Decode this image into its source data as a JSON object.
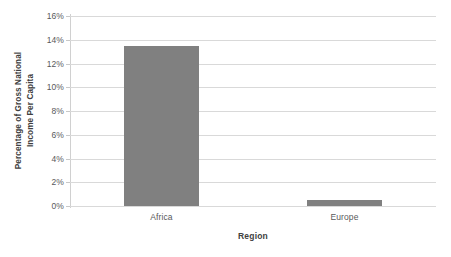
{
  "chart_data": {
    "type": "bar",
    "title": "",
    "subtitle": "",
    "categories": [
      "Africa",
      "Europe"
    ],
    "values": [
      13.5,
      0.5
    ],
    "series": [
      {
        "name": "Percentage of Gross National Income Per Capita",
        "values": [
          13.5,
          0.5
        ]
      }
    ],
    "xlabel": "Region",
    "ylabel": "Percentage of Gross National Income Per Capita",
    "ylabel_line1": "Percentage of Gross National",
    "ylabel_line2": "Income Per Capita",
    "ylim": [
      0,
      16
    ],
    "ytick_values": [
      0,
      2,
      4,
      6,
      8,
      10,
      12,
      14,
      16
    ],
    "ytick_labels": [
      "0%",
      "2%",
      "4%",
      "6%",
      "8%",
      "10%",
      "12%",
      "14%",
      "16%"
    ],
    "grid": true,
    "grid_axis": "y",
    "legend": false,
    "legend_position": "none",
    "bar_color": "#808080",
    "gridline_color": "#D9D9D9",
    "axis_color": "#D0D0D0",
    "text_color": "#58595B",
    "title_color": "#404040",
    "background_color": "#FFFFFF"
  }
}
